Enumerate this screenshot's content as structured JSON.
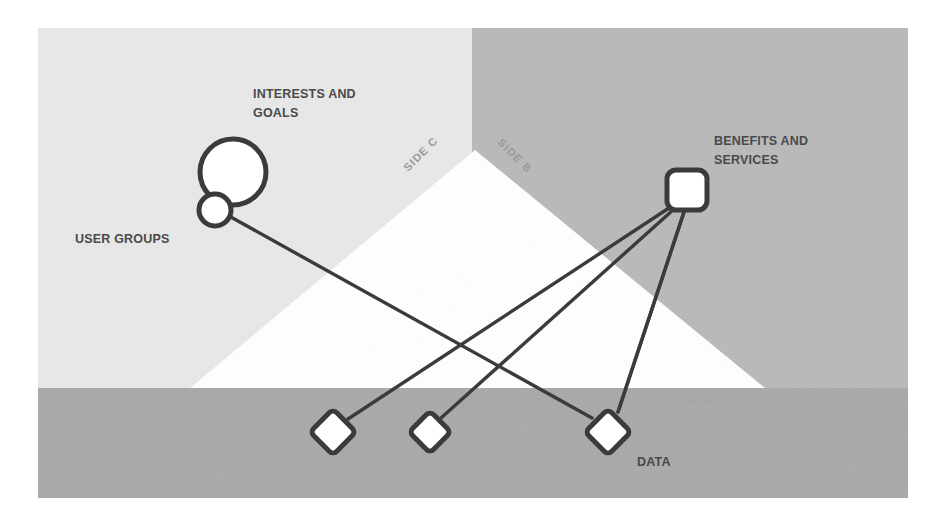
{
  "canvas": {
    "width": 945,
    "height": 521,
    "background": "#ffffff"
  },
  "panel": {
    "x": 38,
    "y": 28,
    "width": 870,
    "height": 470,
    "regions": {
      "upper_left_color": "#e8e8e8",
      "upper_right_color": "#b9b9b9",
      "bottom_band_color": "#a9a9a9",
      "triangle_color": "#ffffff"
    },
    "vertical_divider_x": 472,
    "bottom_band_top_y": 388,
    "triangle": {
      "apex_x": 475,
      "apex_y": 150,
      "base_left_x": 190,
      "base_right_x": 765,
      "base_y": 388
    }
  },
  "side_labels": [
    {
      "id": "side-a",
      "text": "SIDE A",
      "x": 682,
      "y": 404,
      "rotation": 0
    },
    {
      "id": "side-b",
      "text": "SIDE B",
      "x": 497,
      "y": 143,
      "rotation": 45
    },
    {
      "id": "side-c",
      "text": "SIDE C",
      "x": 408,
      "y": 172,
      "rotation": -45
    }
  ],
  "nodes": [
    {
      "id": "interests-and-goals",
      "label": "INTERESTS AND GOALS",
      "label_lines": [
        "INTERESTS AND",
        "GOALS"
      ],
      "shape": "circle",
      "cx": 233,
      "cy": 172,
      "r": 33,
      "fill": "#ffffff",
      "stroke": "#3b3b3b",
      "stroke_width": 5,
      "label_x": 253,
      "label_y": 98
    },
    {
      "id": "user-groups",
      "label": "USER GROUPS",
      "label_lines": [
        "USER GROUPS"
      ],
      "shape": "circle",
      "cx": 215,
      "cy": 210,
      "r": 16,
      "fill": "#ffffff",
      "stroke": "#3b3b3b",
      "stroke_width": 5,
      "label_x": 75,
      "label_y": 243
    },
    {
      "id": "benefits-and-services",
      "label": "BENEFITS AND SERVICES",
      "label_lines": [
        "BENEFITS AND",
        "SERVICES"
      ],
      "shape": "rounded-square",
      "cx": 687,
      "cy": 190,
      "size": 40,
      "corner_radius": 9,
      "fill": "#ffffff",
      "stroke": "#3b3b3b",
      "stroke_width": 5,
      "label_x": 714,
      "label_y": 145
    },
    {
      "id": "data-node-1",
      "label": "",
      "label_lines": [],
      "shape": "diamond",
      "cx": 333,
      "cy": 432,
      "r": 23,
      "corner_radius": 5,
      "fill": "#ffffff",
      "stroke": "#3b3b3b",
      "stroke_width": 5
    },
    {
      "id": "data-node-2",
      "label": "",
      "label_lines": [],
      "shape": "diamond",
      "cx": 430,
      "cy": 432,
      "r": 21,
      "corner_radius": 5,
      "fill": "#ffffff",
      "stroke": "#3b3b3b",
      "stroke_width": 5
    },
    {
      "id": "data-node-3",
      "label": "DATA",
      "label_lines": [
        "DATA"
      ],
      "shape": "diamond",
      "cx": 608,
      "cy": 432,
      "r": 23,
      "corner_radius": 5,
      "fill": "#ffffff",
      "stroke": "#3b3b3b",
      "stroke_width": 5,
      "label_x": 637,
      "label_y": 465
    }
  ],
  "edges": [
    {
      "id": "edge-usergroups-data1",
      "from": "user-groups",
      "to": "data-node-1",
      "x1": 222,
      "y1": 224,
      "x2": 328,
      "y2": 412
    },
    {
      "id": "edge-usergroups-data3",
      "from": "user-groups",
      "to": "data-node-3",
      "x1": 229,
      "y1": 216,
      "x2": 592,
      "y2": 418
    },
    {
      "id": "edge-benefits-data1",
      "from": "benefits-and-services",
      "to": "data-node-1",
      "x1": 669,
      "y1": 208,
      "x2": 348,
      "y2": 419
    },
    {
      "id": "edge-benefits-data2",
      "from": "benefits-and-services",
      "to": "data-node-2",
      "x1": 673,
      "y1": 210,
      "x2": 441,
      "y2": 418
    },
    {
      "id": "edge-benefits-data3",
      "from": "benefits-and-services",
      "to": "data-node-3",
      "x1": 684,
      "y1": 212,
      "x2": 618,
      "y2": 412
    }
  ],
  "edge_style": {
    "stroke": "#3b3b3b",
    "stroke_width": 3.4
  }
}
